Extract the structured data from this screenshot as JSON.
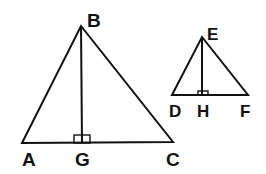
{
  "diagram": {
    "title": "",
    "colors": {
      "line": "#111111",
      "background": "#ffffff"
    },
    "triangles": [
      {
        "name": "ABC",
        "vertices": [
          {
            "label": "A",
            "x": 22,
            "y": 143
          },
          {
            "label": "B",
            "x": 81,
            "y": 26
          },
          {
            "label": "C",
            "x": 173,
            "y": 142
          }
        ],
        "altitude": {
          "from": "B",
          "foot": "G",
          "foot_x": 82,
          "foot_y": 143,
          "right_angle_mark": true
        }
      },
      {
        "name": "DEF",
        "vertices": [
          {
            "label": "D",
            "x": 172,
            "y": 95
          },
          {
            "label": "E",
            "x": 202,
            "y": 37
          },
          {
            "label": "F",
            "x": 248,
            "y": 95
          }
        ],
        "altitude": {
          "from": "E",
          "foot": "H",
          "foot_x": 202,
          "foot_y": 95,
          "right_angle_mark": true
        }
      }
    ],
    "labels": {
      "A": "A",
      "B": "B",
      "C": "C",
      "G": "G",
      "D": "D",
      "E": "E",
      "F": "F",
      "H": "H"
    }
  }
}
